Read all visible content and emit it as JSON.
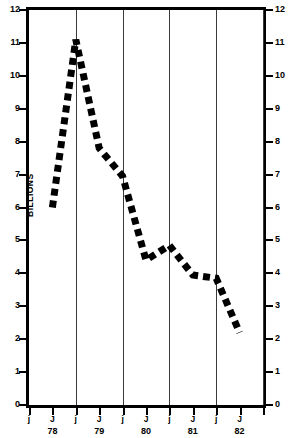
{
  "chart_data": {
    "type": "line",
    "title": "",
    "xlabel": "",
    "ylabel": "BILLIONS",
    "ylabel_right": "BILLIONS",
    "ylim": [
      0,
      12
    ],
    "grid": true,
    "legend": null,
    "y_ticks": [
      0,
      1,
      2,
      3,
      4,
      5,
      6,
      7,
      8,
      9,
      10,
      11,
      12
    ],
    "y_tick_labels": [
      "0",
      "1",
      "2",
      "3",
      "4",
      "5",
      "6",
      "7",
      "8",
      "9",
      "10",
      "11",
      "12"
    ],
    "x_tick_labels": [
      "j",
      "J",
      "j",
      "J",
      "j",
      "J",
      "j",
      "J",
      "j",
      "J"
    ],
    "x_year_labels": [
      "78",
      "79",
      "80",
      "81",
      "82"
    ],
    "x": [
      0.5,
      1.0,
      1.5,
      2.0,
      2.5,
      3.0,
      3.5,
      4.0,
      4.5
    ],
    "x_points_labels": [
      "J 78",
      "j 79",
      "J 79",
      "j 80",
      "J 80",
      "j 81",
      "J 81",
      "j 82",
      "J 82"
    ],
    "values": [
      6.0,
      11.1,
      7.8,
      6.95,
      4.4,
      4.85,
      3.95,
      3.85,
      2.2
    ],
    "series": [
      {
        "name": "series-1",
        "values": [
          6.0,
          11.1,
          7.8,
          6.95,
          4.4,
          4.85,
          3.95,
          3.85,
          2.2
        ]
      }
    ],
    "gridline_positions": [
      1,
      2,
      3,
      4,
      5
    ],
    "line_style": "dashed",
    "line_color": "#000000"
  }
}
